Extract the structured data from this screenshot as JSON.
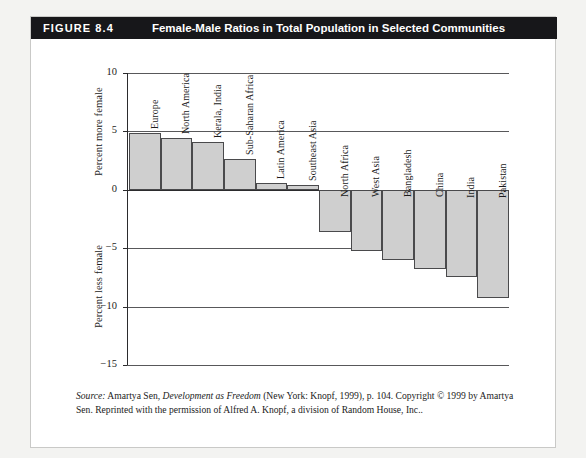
{
  "figure": {
    "number_label": "FIGURE 8.4",
    "title": "Female-Male Ratios in Total Population in Selected Communities"
  },
  "axis": {
    "upper_title": "Percent more female",
    "lower_title": "Percent less female",
    "tick_labels": [
      "10",
      "5",
      "0",
      "−5",
      "−10",
      "−15"
    ]
  },
  "source": {
    "prefix": "Source:",
    "text_a": " Amartya Sen, ",
    "book": "Development as Freedom",
    "text_b": " (New York: Knopf, 1999), p. 104. Copyright © 1999 by Amartya Sen. Reprinted with the permission of Alfred A. Knopf, a division of Random House, Inc.."
  },
  "colors": {
    "header_bg": "#17171a",
    "header_text": "#ffffff",
    "bar_fill": "#cfcfcf",
    "bar_stroke": "#4a4a4c",
    "grid": "#58585a",
    "axis": "#2b2b2d",
    "card_bg": "#ffffff",
    "page_bg": "#f3f3f1"
  },
  "chart_data": {
    "type": "bar",
    "title": "Female-Male Ratios in Total Population in Selected Communities",
    "xlabel": "",
    "ylabel": "Percent more female / Percent less female",
    "ylim": [
      -15,
      10
    ],
    "yticks": [
      10,
      5,
      0,
      -5,
      -10,
      -15
    ],
    "grid": true,
    "legend": "none",
    "orientation": "vertical",
    "categories": [
      "Europe",
      "North America",
      "Kerala, India",
      "Sub-Saharan Africa",
      "Latin America",
      "Southeast Asia",
      "North Africa",
      "West Asia",
      "Bangladesh",
      "China",
      "India",
      "Pakistan"
    ],
    "values": [
      4.9,
      4.4,
      4.1,
      2.6,
      0.6,
      0.4,
      -3.6,
      -5.2,
      -6.0,
      -6.8,
      -7.5,
      -9.3
    ]
  }
}
